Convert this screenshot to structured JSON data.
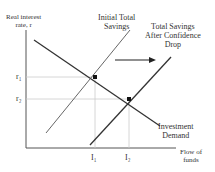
{
  "diagram": {
    "y_axis_label": [
      "Real interest",
      "rate, r"
    ],
    "x_axis_label": [
      "Flow of",
      "funds"
    ],
    "y_ticks": [
      "r₁",
      "r₂"
    ],
    "x_ticks": [
      "I₁",
      "I₂"
    ],
    "curves": {
      "initial_savings": [
        "Initial Total",
        "Savings"
      ],
      "shifted_savings": [
        "Total Savings",
        "After Confidence",
        "Drop"
      ],
      "investment_demand": [
        "Investment",
        "Demand"
      ]
    },
    "shift_arrow": "right",
    "colors": {
      "lines": "#333333",
      "guides": "#cccccc"
    }
  }
}
